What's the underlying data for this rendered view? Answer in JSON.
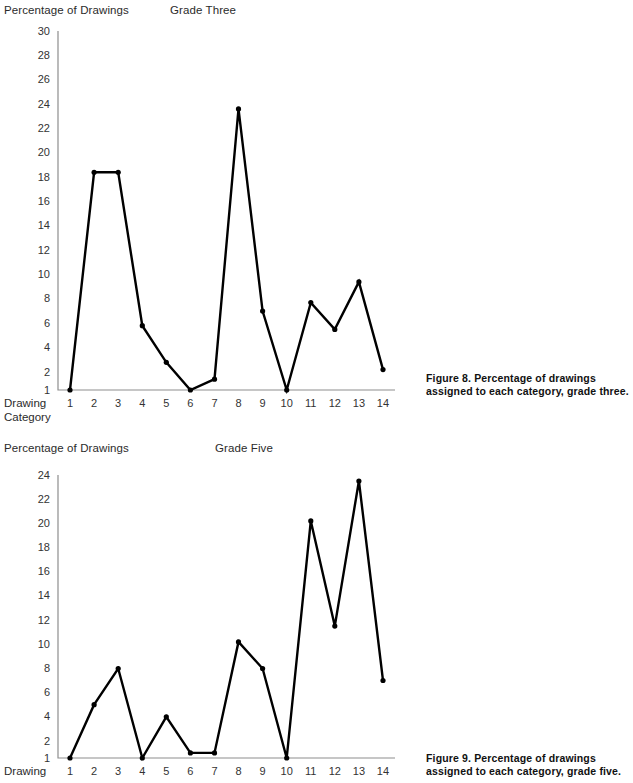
{
  "figures": [
    {
      "id": "figure-8",
      "plot_heading": "Grade Three",
      "y_axis_title": "Percentage of Drawings",
      "x_axis_label": "Drawing\nCategory",
      "caption": "Figure 8. Percentage of drawings assigned to each category, grade three.",
      "chart_data": {
        "type": "line",
        "title": "Grade Three",
        "xlabel": "Drawing Category",
        "ylabel": "Percentage of Drawings",
        "xlim": [
          1,
          14
        ],
        "ylim": [
          1,
          30
        ],
        "grid": false,
        "legend": "none",
        "x": [
          1,
          2,
          3,
          4,
          5,
          6,
          7,
          8,
          9,
          10,
          11,
          12,
          13,
          14
        ],
        "xticklabels": [
          "1",
          "2",
          "3",
          "4",
          "5",
          "6",
          "7",
          "8",
          "9",
          "10",
          "11",
          "12",
          "13",
          "14"
        ],
        "yticklabels": [
          "1",
          "2",
          "4",
          "6",
          "8",
          "10",
          "12",
          "14",
          "16",
          "18",
          "20",
          "22",
          "24",
          "26",
          "28",
          "30"
        ],
        "yticks": [
          1,
          2,
          4,
          6,
          8,
          10,
          12,
          14,
          16,
          18,
          20,
          22,
          24,
          26,
          28,
          30
        ],
        "series": [
          {
            "name": "Grade Three",
            "values": [
              1.0,
              18.4,
              18.4,
              5.8,
              2.8,
              1.0,
              1.6,
              23.6,
              7.0,
              1.0,
              7.7,
              5.5,
              9.4,
              2.2
            ]
          }
        ],
        "marker": "circle",
        "line_color": "#000000"
      }
    },
    {
      "id": "figure-9",
      "plot_heading": "Grade Five",
      "y_axis_title": "Percentage of Drawings",
      "x_axis_label": "Drawing",
      "caption": "Figure 9. Percentage of drawings assigned to each category, grade five.",
      "chart_data": {
        "type": "line",
        "title": "Grade Five",
        "xlabel": "Drawing Category",
        "ylabel": "Percentage of Drawings",
        "xlim": [
          1,
          14
        ],
        "ylim": [
          1,
          24
        ],
        "grid": false,
        "legend": "none",
        "x": [
          1,
          2,
          3,
          4,
          5,
          6,
          7,
          8,
          9,
          10,
          11,
          12,
          13,
          14
        ],
        "xticklabels": [
          "1",
          "2",
          "3",
          "4",
          "5",
          "6",
          "7",
          "8",
          "9",
          "10",
          "11",
          "12",
          "13",
          "14"
        ],
        "yticklabels": [
          "1",
          "2",
          "4",
          "6",
          "8",
          "10",
          "12",
          "14",
          "16",
          "18",
          "20",
          "22",
          "24"
        ],
        "yticks": [
          1,
          2,
          4,
          6,
          8,
          10,
          12,
          14,
          16,
          18,
          20,
          22,
          24
        ],
        "series": [
          {
            "name": "Grade Five",
            "values": [
              1.0,
              5.0,
              8.0,
              1.0,
              4.0,
              1.3,
              1.3,
              10.2,
              8.0,
              1.0,
              20.2,
              11.5,
              23.5,
              7.0
            ]
          }
        ],
        "marker": "circle",
        "line_color": "#000000"
      }
    }
  ]
}
